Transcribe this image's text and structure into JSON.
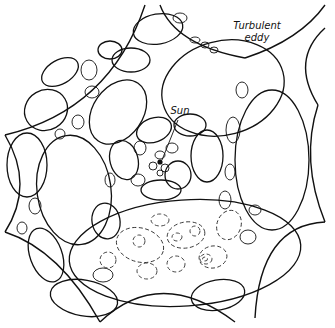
{
  "diagram": {
    "type": "illustration",
    "labels": {
      "eddy_line1": "Turbulent",
      "eddy_line2": "eddy",
      "sun": "Sun"
    },
    "colors": {
      "ink": "#111111",
      "background": "#ffffff"
    }
  }
}
